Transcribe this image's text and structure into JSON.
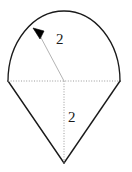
{
  "figure": {
    "background_color": "#ffffff",
    "stroke_color": "#1a1a1a",
    "dotted_color": "#9a9a9a",
    "radius_line_color": "#b0b0b0",
    "arrowhead_color": "#000000",
    "labels": {
      "radius": "2",
      "height": "2"
    },
    "icons": {
      "arrowhead": "arrowhead-icon"
    },
    "geometry": {
      "center_x": 64,
      "center_y": 81,
      "arc_left_x": 8,
      "arc_right_x": 120,
      "arc_top_y": 11,
      "apex_x": 64,
      "apex_y": 163,
      "arrow_tip_x": 34,
      "arrow_tip_y": 28,
      "radius_value": 2,
      "height_value": 2
    }
  }
}
